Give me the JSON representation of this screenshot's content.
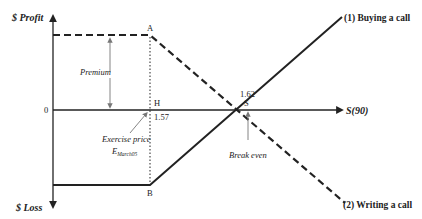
{
  "diagram": {
    "axes": {
      "y_top_label": "$ Profit",
      "y_bottom_label": "$ Loss",
      "x_label": "S(90)",
      "origin_label": "0"
    },
    "points": {
      "A": "A",
      "H": "H",
      "B": "B",
      "S": "S"
    },
    "values": {
      "exercise_value": "1.57",
      "breakeven_value": "1.62"
    },
    "annotations": {
      "premium": "Premium",
      "exercise_price": "Exercise price",
      "exercise_symbol": "E",
      "exercise_subscript": "March05",
      "break_even": "Break even"
    },
    "lines": {
      "buying_call": "(1) Buying a call",
      "writing_call": "(2) Writing a call"
    },
    "colors": {
      "ink": "#222222",
      "annotation": "#777777"
    }
  }
}
